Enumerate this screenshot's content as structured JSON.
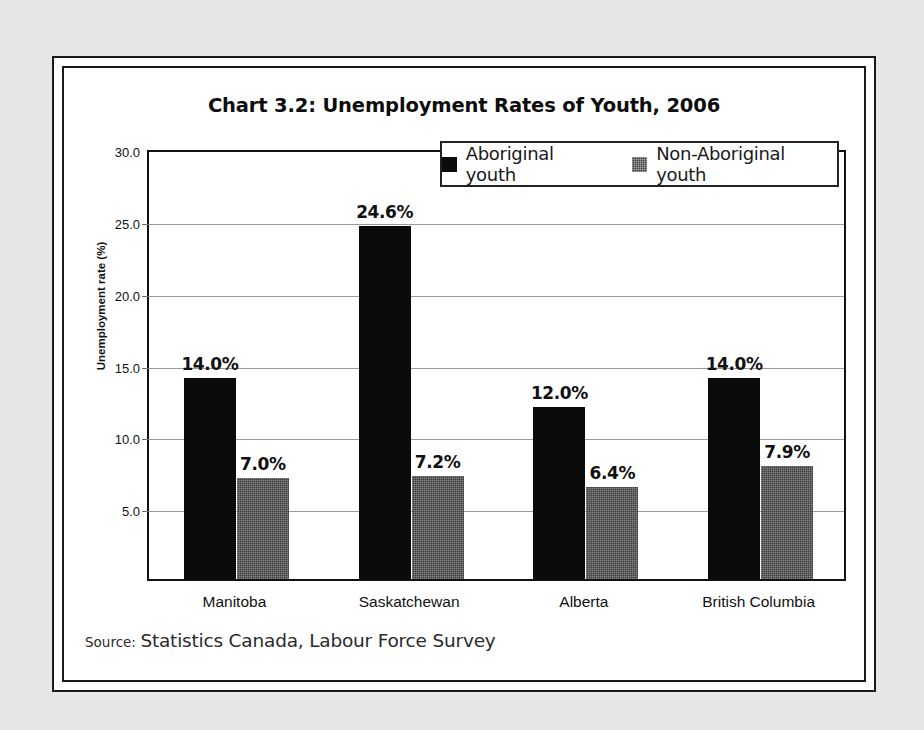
{
  "chart_data": {
    "type": "bar",
    "title": "Chart 3.2:  Unemployment Rates of Youth, 2006",
    "xlabel": "",
    "ylabel": "Unemployment rate (%)",
    "ylim": [
      0,
      30
    ],
    "ytick_labels": [
      "30.0",
      "25.0",
      "20.0",
      "15.0",
      "10.0",
      "5.0"
    ],
    "ytick_values": [
      30.0,
      25.0,
      20.0,
      15.0,
      10.0,
      5.0
    ],
    "grid": true,
    "legend_position": "top-right-inside",
    "categories": [
      "Manitoba",
      "Saskatchewan",
      "Alberta",
      "British Columbia"
    ],
    "series": [
      {
        "name": "Aboriginal youth",
        "color": "#0b0b0b",
        "values": [
          14.0,
          24.6,
          12.0,
          14.0
        ],
        "labels": [
          "14.0%",
          "24.6%",
          "12.0%",
          "14.0%"
        ]
      },
      {
        "name": "Non-Aboriginal youth",
        "color": "#3b3b3b",
        "values": [
          7.0,
          7.2,
          6.4,
          7.9
        ],
        "labels": [
          "7.0%",
          "7.2%",
          "6.4%",
          "7.9%"
        ]
      }
    ],
    "source_label": "Source:",
    "source_text": "Statistics Canada, Labour Force Survey"
  }
}
